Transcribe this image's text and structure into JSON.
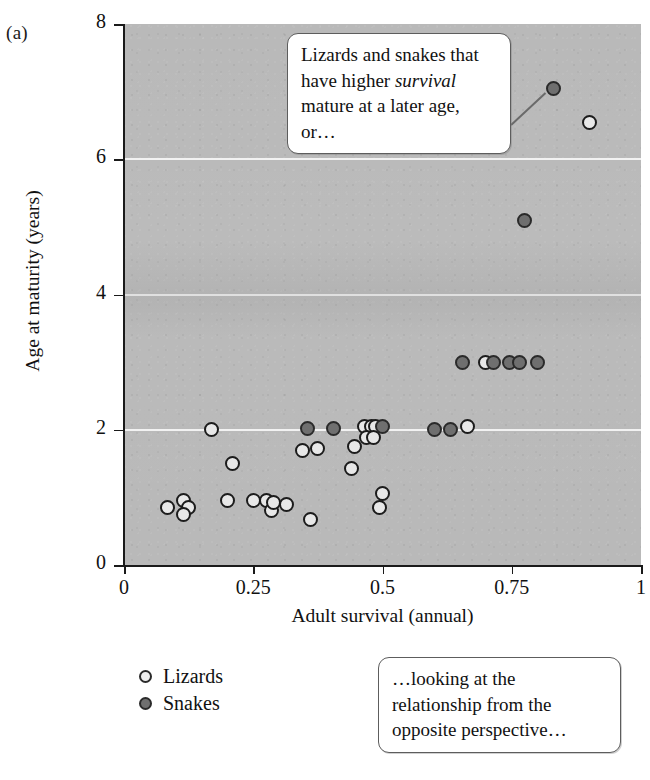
{
  "panel": {
    "label": "(a)"
  },
  "chart_data": {
    "type": "scatter",
    "title": "",
    "xlabel": "Adult survival (annual)",
    "ylabel": "Age at maturity (years)",
    "xlim": [
      0,
      1
    ],
    "ylim": [
      0,
      8
    ],
    "xticks": [
      "0",
      "0.25",
      "0.5",
      "0.75",
      "1"
    ],
    "xtick_values": [
      0,
      0.25,
      0.5,
      0.75,
      1
    ],
    "yticks": [
      "0",
      "2",
      "4",
      "6",
      "8"
    ],
    "ytick_values": [
      0,
      2,
      4,
      6,
      8
    ],
    "gridlines_y": [
      2,
      4,
      6
    ],
    "grid": true,
    "plot_background": "#b9b9b9",
    "gridline_color": "#f2f2f2",
    "legend_position": "below-left",
    "series": [
      {
        "name": "Lizards",
        "marker": "open-circle",
        "color": "#e8e8e8",
        "edge_color": "#1c1c1c",
        "points": [
          [
            0.085,
            0.85
          ],
          [
            0.115,
            0.95
          ],
          [
            0.125,
            0.85
          ],
          [
            0.115,
            0.74
          ],
          [
            0.17,
            2.0
          ],
          [
            0.21,
            1.5
          ],
          [
            0.2,
            0.95
          ],
          [
            0.25,
            0.95
          ],
          [
            0.275,
            0.95
          ],
          [
            0.285,
            0.8
          ],
          [
            0.29,
            0.92
          ],
          [
            0.315,
            0.9
          ],
          [
            0.345,
            1.7
          ],
          [
            0.375,
            1.72
          ],
          [
            0.36,
            0.68
          ],
          [
            0.44,
            1.42
          ],
          [
            0.445,
            1.75
          ],
          [
            0.465,
            2.05
          ],
          [
            0.478,
            2.05
          ],
          [
            0.487,
            2.05
          ],
          [
            0.47,
            1.88
          ],
          [
            0.483,
            1.88
          ],
          [
            0.5,
            1.05
          ],
          [
            0.495,
            0.85
          ],
          [
            0.665,
            2.05
          ],
          [
            0.7,
            3.0
          ],
          [
            0.9,
            6.55
          ]
        ]
      },
      {
        "name": "Snakes",
        "marker": "filled-circle",
        "color": "#6f6f6f",
        "edge_color": "#2a2a2a",
        "points": [
          [
            0.355,
            2.02
          ],
          [
            0.405,
            2.02
          ],
          [
            0.5,
            2.05
          ],
          [
            0.6,
            2.0
          ],
          [
            0.632,
            2.0
          ],
          [
            0.655,
            3.0
          ],
          [
            0.715,
            3.0
          ],
          [
            0.745,
            3.0
          ],
          [
            0.765,
            3.0
          ],
          [
            0.8,
            3.0
          ],
          [
            0.775,
            5.1
          ],
          [
            0.83,
            7.05
          ]
        ]
      }
    ],
    "annotations": [
      {
        "id": "callout-upper",
        "lines": [
          {
            "text": "Lizards and snakes that"
          },
          {
            "text": "have higher ",
            "italic_text": "survival"
          },
          {
            "text": "mature at a later age,"
          },
          {
            "text": "or…"
          }
        ],
        "leader_target": [
          0.83,
          7.05
        ]
      },
      {
        "id": "callout-lower",
        "lines": [
          {
            "text": "…looking at the"
          },
          {
            "text": "relationship from the"
          },
          {
            "text": "opposite perspective…"
          }
        ]
      }
    ]
  },
  "callout_upper": {
    "line1": "Lizards and snakes that",
    "line2_a": "have higher ",
    "line2_italic": "survival",
    "line3": "mature at a later age,",
    "line4": "or…"
  },
  "callout_lower": {
    "line1": "…looking at the",
    "line2": "relationship from the",
    "line3": "opposite perspective…"
  },
  "legend": {
    "items": [
      {
        "label": "Lizards",
        "marker": "open-circle"
      },
      {
        "label": "Snakes",
        "marker": "filled-circle"
      }
    ]
  }
}
